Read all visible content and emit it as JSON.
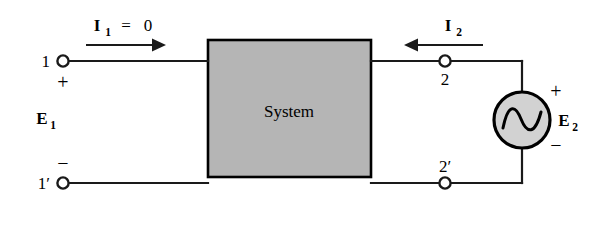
{
  "figure": {
    "type": "two-port-network-circuit-diagram",
    "background_color": "#ffffff",
    "line_color": "#1a1a1a"
  },
  "system_block": {
    "label": "System",
    "fill_color": "#b5b5b5",
    "border_color": "#000000"
  },
  "left_port": {
    "top_terminal_label": "1",
    "bottom_terminal_label": "1′",
    "top_polarity": "+",
    "bottom_polarity": "−",
    "voltage_symbol": "E",
    "voltage_subscript": "1",
    "current_symbol": "I",
    "current_subscript": "1",
    "current_equals": "=",
    "current_value": "0",
    "current_direction": "right"
  },
  "right_port": {
    "top_terminal_label": "2",
    "bottom_terminal_label": "2′",
    "current_symbol": "I",
    "current_subscript": "2",
    "current_direction": "left"
  },
  "source": {
    "kind": "ac-voltage-source",
    "symbol": "sine-wave",
    "voltage_symbol": "E",
    "voltage_subscript": "2",
    "top_polarity": "+",
    "bottom_polarity": "−",
    "fill_color": "#d2d2d2",
    "border_color": "#000000"
  }
}
